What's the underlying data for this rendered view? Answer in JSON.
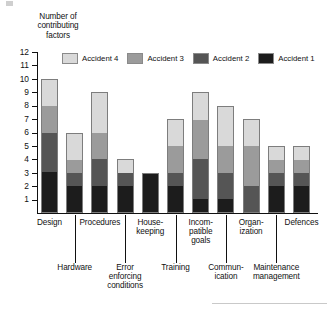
{
  "chart_data": {
    "type": "bar",
    "subtype": "stacked-bar",
    "title": "",
    "xlabel": "",
    "ylabel": "Number of contributing factors",
    "ylim": [
      0,
      12
    ],
    "yticks": [
      1,
      2,
      3,
      4,
      5,
      6,
      7,
      8,
      9,
      10,
      11,
      12
    ],
    "grid": false,
    "legend_position": "top-inside",
    "categories": [
      "Design",
      "Hardware",
      "Procedures",
      "Error enforcing conditions",
      "House-keeping",
      "Training",
      "Incompatible goals",
      "Communication",
      "Organization",
      "Maintenance management",
      "Defences"
    ],
    "series": [
      {
        "name": "Accident 1",
        "color": "#1c1c1c",
        "values": [
          3,
          2,
          2,
          2,
          3,
          2,
          1,
          1,
          0,
          2,
          2
        ]
      },
      {
        "name": "Accident 2",
        "color": "#555555",
        "values": [
          3,
          1,
          2,
          1,
          0,
          1,
          3,
          2,
          2,
          1,
          1
        ]
      },
      {
        "name": "Accident 3",
        "color": "#9b9b9b",
        "values": [
          2,
          1,
          2,
          0,
          0,
          2,
          3,
          2,
          3,
          1,
          1
        ]
      },
      {
        "name": "Accident 4",
        "color": "#d9d9d9",
        "values": [
          2,
          2,
          3,
          1,
          0,
          2,
          2,
          3,
          2,
          1,
          1
        ]
      }
    ],
    "totals": [
      10,
      6,
      9,
      4,
      3,
      7,
      9,
      8,
      7,
      5,
      5
    ]
  },
  "yaxis": {
    "title_lines": [
      "Number of",
      "contributing",
      "factors"
    ],
    "ticks": [
      "12",
      "11",
      "10",
      "9",
      "8",
      "7",
      "6",
      "5",
      "4",
      "3",
      "2",
      "1"
    ]
  },
  "legend": {
    "items": [
      {
        "label": "Accident 4",
        "color": "#d9d9d9"
      },
      {
        "label": "Accident 3",
        "color": "#9b9b9b"
      },
      {
        "label": "Accident 2",
        "color": "#555555"
      },
      {
        "label": "Accident 1",
        "color": "#1c1c1c"
      }
    ]
  },
  "xaxis": {
    "labels": [
      {
        "lines": [
          "Design"
        ],
        "row": 0
      },
      {
        "lines": [
          "Hardware"
        ],
        "row": 1
      },
      {
        "lines": [
          "Procedures"
        ],
        "row": 0
      },
      {
        "lines": [
          "Error",
          "enforcing",
          "conditions"
        ],
        "row": 1
      },
      {
        "lines": [
          "House-",
          "keeping"
        ],
        "row": 0
      },
      {
        "lines": [
          "Training"
        ],
        "row": 1
      },
      {
        "lines": [
          "Incom-",
          "patible",
          "goals"
        ],
        "row": 0
      },
      {
        "lines": [
          "Commun-",
          "ication"
        ],
        "row": 1
      },
      {
        "lines": [
          "Organ-",
          "ization"
        ],
        "row": 0
      },
      {
        "lines": [
          "Maintenance",
          "management"
        ],
        "row": 1
      },
      {
        "lines": [
          "Defences"
        ],
        "row": 0
      }
    ]
  }
}
